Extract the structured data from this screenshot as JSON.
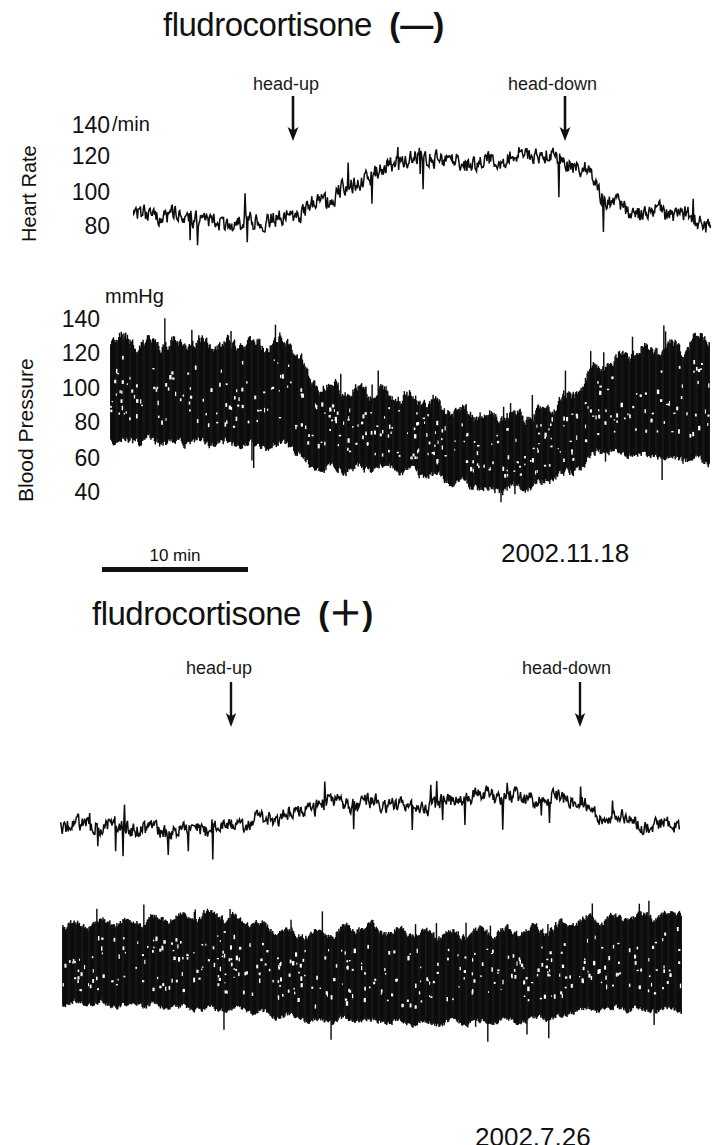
{
  "figure": {
    "background": "#ffffff",
    "ink": "#111111",
    "width": 720,
    "height": 1145
  },
  "panels": [
    {
      "id": "panel-a",
      "title_text": "fludrocortisone",
      "title_sign": "(—)",
      "title_sign_name": "minus",
      "date": "2002.11.18",
      "events": [
        {
          "label": "head-up",
          "label_x": 253,
          "arrow_x": 293,
          "label_y": 74,
          "arrow_y": 96
        },
        {
          "label": "head-down",
          "label_x": 508,
          "arrow_x": 565,
          "label_y": 74,
          "arrow_y": 96
        }
      ],
      "traces": [
        {
          "id": "hr-a",
          "kind": "line",
          "ylabel": "Heart Rate",
          "unit": "/min",
          "unit_x": 112,
          "unit_y": 113,
          "ticks": [
            140,
            120,
            100,
            80
          ],
          "tick_x_right": 110,
          "tick_ys": [
            126,
            156,
            192,
            226
          ],
          "ylim": [
            60,
            150
          ],
          "plot": {
            "x": 133,
            "y": 112,
            "w": 578,
            "h": 150
          }
        },
        {
          "id": "bp-a",
          "kind": "band",
          "ylabel": "Blood Pressure",
          "unit": "mmHg",
          "unit_x": 105,
          "unit_y": 288,
          "ticks": [
            140,
            120,
            100,
            80,
            60,
            40
          ],
          "tick_x_right": 100,
          "tick_ys": [
            311,
            345,
            380,
            414,
            450,
            484
          ],
          "ylim": [
            25,
            152
          ],
          "plot": {
            "x": 110,
            "y": 310,
            "w": 600,
            "h": 200
          }
        }
      ]
    },
    {
      "id": "panel-b",
      "title_text": "fludrocortisone",
      "title_sign": "(＋)",
      "title_sign_name": "plus",
      "date": "2002.7.26",
      "events": [
        {
          "label": "head-up",
          "label_x": 186,
          "arrow_x": 231,
          "label_y": 658,
          "arrow_y": 682
        },
        {
          "label": "head-down",
          "label_x": 522,
          "arrow_x": 580,
          "label_y": 658,
          "arrow_y": 682
        }
      ],
      "traces": [
        {
          "id": "hr-b",
          "kind": "line",
          "ylabel": "",
          "unit": "",
          "ticks": [],
          "tick_ys": [],
          "ylim": [
            60,
            150
          ],
          "plot": {
            "x": 60,
            "y": 735,
            "w": 620,
            "h": 135
          }
        },
        {
          "id": "bp-b",
          "kind": "band",
          "ylabel": "",
          "unit": "",
          "ticks": [],
          "tick_ys": [],
          "ylim": [
            25,
            152
          ],
          "plot": {
            "x": 62,
            "y": 900,
            "w": 620,
            "h": 145
          }
        }
      ]
    }
  ],
  "scalebar": {
    "label": "10 min",
    "x": 102,
    "y": 546,
    "width": 146
  },
  "chart_data": {
    "type": "line",
    "xlabel": "time",
    "ylabel": "Heart Rate (/min) and Blood Pressure (mmHg)",
    "grid": false,
    "legend": "none",
    "x_scale_label": "10 min",
    "panels": [
      {
        "name": "fludrocortisone (—)",
        "date": "2002.11.18",
        "event_markers": [
          {
            "label": "head-up",
            "x_frac": 0.28
          },
          {
            "label": "head-down",
            "x_frac": 0.75
          }
        ],
        "series": [
          {
            "name": "Heart Rate",
            "unit": "/min",
            "yticks": [
              140,
              120,
              100,
              80
            ],
            "ylim": [
              60,
              150
            ],
            "x_frac": [
              0.0,
              0.05,
              0.1,
              0.15,
              0.2,
              0.25,
              0.28,
              0.32,
              0.37,
              0.42,
              0.47,
              0.52,
              0.57,
              0.62,
              0.67,
              0.72,
              0.75,
              0.78,
              0.82,
              0.86,
              0.9,
              0.95,
              1.0
            ],
            "values": [
              88,
              86,
              87,
              85,
              84,
              84,
              85,
              95,
              107,
              114,
              120,
              122,
              121,
              122,
              123,
              121,
              119,
              116,
              100,
              90,
              88,
              87,
              83
            ],
            "noise_amplitude": 7
          },
          {
            "name": "Blood Pressure",
            "unit": "mmHg",
            "yticks": [
              140,
              120,
              100,
              80,
              60,
              40
            ],
            "ylim": [
              25,
              152
            ],
            "x_frac": [
              0.0,
              0.06,
              0.12,
              0.18,
              0.24,
              0.3,
              0.34,
              0.4,
              0.46,
              0.52,
              0.58,
              0.64,
              0.7,
              0.76,
              0.82,
              0.88,
              0.94,
              1.0
            ],
            "systolic": [
              134,
              131,
              130,
              131,
              130,
              132,
              106,
              101,
              99,
              95,
              88,
              84,
              86,
              95,
              118,
              126,
              128,
              136
            ],
            "diastolic": [
              70,
              69,
              68,
              67,
              66,
              66,
              52,
              51,
              52,
              48,
              42,
              38,
              40,
              48,
              62,
              60,
              58,
              56
            ],
            "noise_amplitude": 6
          }
        ]
      },
      {
        "name": "fludrocortisone (＋)",
        "date": "2002.7.26",
        "event_markers": [
          {
            "label": "head-up",
            "x_frac": 0.275
          },
          {
            "label": "head-down",
            "x_frac": 0.838
          }
        ],
        "series": [
          {
            "name": "Heart Rate",
            "unit": "/min",
            "yticks": [],
            "ylim": [
              60,
              150
            ],
            "x_frac": [
              0.0,
              0.05,
              0.1,
              0.15,
              0.2,
              0.25,
              0.28,
              0.33,
              0.38,
              0.43,
              0.48,
              0.53,
              0.58,
              0.63,
              0.68,
              0.73,
              0.78,
              0.82,
              0.84,
              0.87,
              0.91,
              0.95,
              1.0
            ],
            "values": [
              88,
              88,
              89,
              88,
              87,
              86,
              87,
              94,
              101,
              105,
              102,
              104,
              103,
              106,
              108,
              107,
              109,
              110,
              106,
              95,
              92,
              88,
              93
            ],
            "noise_amplitude": 7
          },
          {
            "name": "Blood Pressure",
            "unit": "mmHg",
            "yticks": [],
            "ylim": [
              25,
              152
            ],
            "x_frac": [
              0.0,
              0.06,
              0.12,
              0.18,
              0.24,
              0.3,
              0.36,
              0.42,
              0.48,
              0.54,
              0.6,
              0.66,
              0.72,
              0.78,
              0.84,
              0.9,
              0.96,
              1.0
            ],
            "systolic": [
              130,
              132,
              134,
              136,
              140,
              133,
              123,
              122,
              128,
              124,
              122,
              123,
              124,
              126,
              134,
              136,
              138,
              144
            ],
            "diastolic": [
              62,
              61,
              60,
              58,
              57,
              55,
              50,
              46,
              47,
              45,
              44,
              45,
              46,
              48,
              56,
              57,
              56,
              56
            ],
            "noise_amplitude": 6
          }
        ]
      }
    ]
  }
}
